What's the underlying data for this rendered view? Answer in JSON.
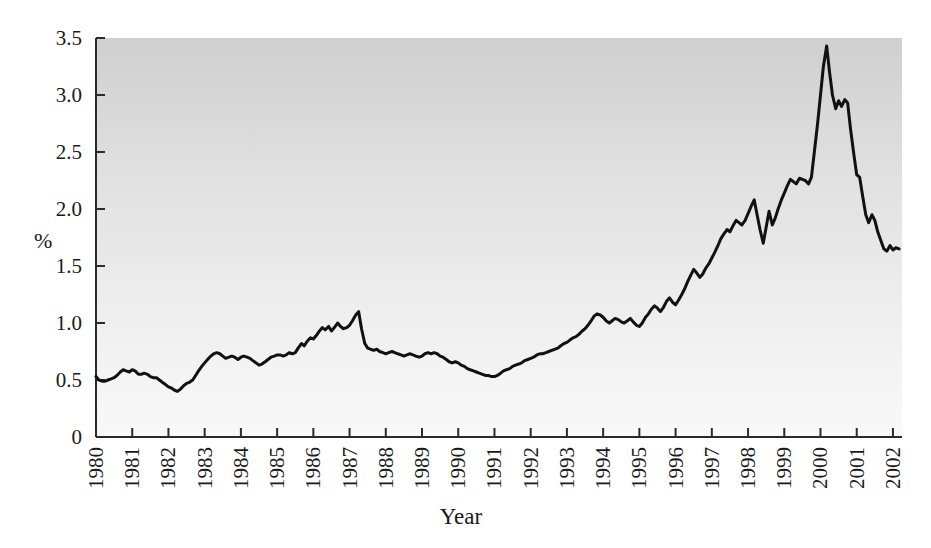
{
  "chart_data": {
    "type": "line",
    "title": "",
    "xlabel": "Year",
    "ylabel": "%",
    "ylim": [
      0,
      3.5
    ],
    "xlim": [
      1980,
      2002.25
    ],
    "yticks": [
      "0",
      "0.5",
      "1.0",
      "1.5",
      "2.0",
      "2.5",
      "3.0",
      "3.5"
    ],
    "ytick_values": [
      0,
      0.5,
      1.0,
      1.5,
      2.0,
      2.5,
      3.0,
      3.5
    ],
    "xticks": [
      "1980",
      "1981",
      "1982",
      "1983",
      "1984",
      "1985",
      "1986",
      "1987",
      "1988",
      "1989",
      "1990",
      "1991",
      "1992",
      "1993",
      "1994",
      "1995",
      "1996",
      "1997",
      "1998",
      "1999",
      "2000",
      "2001",
      "2002"
    ],
    "xtick_values": [
      1980,
      1981,
      1982,
      1983,
      1984,
      1985,
      1986,
      1987,
      1988,
      1989,
      1990,
      1991,
      1992,
      1993,
      1994,
      1995,
      1996,
      1997,
      1998,
      1999,
      2000,
      2001,
      2002
    ],
    "grid": false,
    "legend": false,
    "legend_position": "none",
    "xtick_rotation": 90,
    "plot_background": "vertical-gradient #d2d2d2 to #f7f7f7",
    "line_color": "#111111",
    "series": [
      {
        "name": "percent",
        "x": [
          1980.0,
          1980.08,
          1980.17,
          1980.25,
          1980.33,
          1980.42,
          1980.5,
          1980.58,
          1980.67,
          1980.75,
          1980.83,
          1980.92,
          1981.0,
          1981.08,
          1981.17,
          1981.25,
          1981.33,
          1981.42,
          1981.5,
          1981.58,
          1981.67,
          1981.75,
          1981.83,
          1981.92,
          1982.0,
          1982.08,
          1982.17,
          1982.25,
          1982.33,
          1982.42,
          1982.5,
          1982.58,
          1982.67,
          1982.75,
          1982.83,
          1982.92,
          1983.0,
          1983.08,
          1983.17,
          1983.25,
          1983.33,
          1983.42,
          1983.5,
          1983.58,
          1983.67,
          1983.75,
          1983.83,
          1983.92,
          1984.0,
          1984.08,
          1984.17,
          1984.25,
          1984.33,
          1984.42,
          1984.5,
          1984.58,
          1984.67,
          1984.75,
          1984.83,
          1984.92,
          1985.0,
          1985.08,
          1985.17,
          1985.25,
          1985.33,
          1985.42,
          1985.5,
          1985.58,
          1985.67,
          1985.75,
          1985.83,
          1985.92,
          1986.0,
          1986.08,
          1986.17,
          1986.25,
          1986.33,
          1986.42,
          1986.5,
          1986.58,
          1986.67,
          1986.75,
          1986.83,
          1986.92,
          1987.0,
          1987.08,
          1987.17,
          1987.25,
          1987.33,
          1987.42,
          1987.5,
          1987.58,
          1987.67,
          1987.75,
          1987.83,
          1987.92,
          1988.0,
          1988.08,
          1988.17,
          1988.25,
          1988.33,
          1988.42,
          1988.5,
          1988.58,
          1988.67,
          1988.75,
          1988.83,
          1988.92,
          1989.0,
          1989.08,
          1989.17,
          1989.25,
          1989.33,
          1989.42,
          1989.5,
          1989.58,
          1989.67,
          1989.75,
          1989.83,
          1989.92,
          1990.0,
          1990.08,
          1990.17,
          1990.25,
          1990.33,
          1990.42,
          1990.5,
          1990.58,
          1990.67,
          1990.75,
          1990.83,
          1990.92,
          1991.0,
          1991.08,
          1991.17,
          1991.25,
          1991.33,
          1991.42,
          1991.5,
          1991.58,
          1991.67,
          1991.75,
          1991.83,
          1991.92,
          1992.0,
          1992.08,
          1992.17,
          1992.25,
          1992.33,
          1992.42,
          1992.5,
          1992.58,
          1992.67,
          1992.75,
          1992.83,
          1992.92,
          1993.0,
          1993.08,
          1993.17,
          1993.25,
          1993.33,
          1993.42,
          1993.5,
          1993.58,
          1993.67,
          1993.75,
          1993.83,
          1993.92,
          1994.0,
          1994.08,
          1994.17,
          1994.25,
          1994.33,
          1994.42,
          1994.5,
          1994.58,
          1994.67,
          1994.75,
          1994.83,
          1994.92,
          1995.0,
          1995.08,
          1995.17,
          1995.25,
          1995.33,
          1995.42,
          1995.5,
          1995.58,
          1995.67,
          1995.75,
          1995.83,
          1995.92,
          1996.0,
          1996.08,
          1996.17,
          1996.25,
          1996.33,
          1996.42,
          1996.5,
          1996.58,
          1996.67,
          1996.75,
          1996.83,
          1996.92,
          1997.0,
          1997.08,
          1997.17,
          1997.25,
          1997.33,
          1997.42,
          1997.5,
          1997.58,
          1997.67,
          1997.75,
          1997.83,
          1997.92,
          1998.0,
          1998.08,
          1998.17,
          1998.25,
          1998.33,
          1998.42,
          1998.5,
          1998.58,
          1998.67,
          1998.75,
          1998.83,
          1998.92,
          1999.0,
          1999.08,
          1999.17,
          1999.25,
          1999.33,
          1999.42,
          1999.5,
          1999.58,
          1999.67,
          1999.75,
          1999.83,
          1999.92,
          2000.0,
          2000.08,
          2000.17,
          2000.25,
          2000.33,
          2000.42,
          2000.5,
          2000.58,
          2000.67,
          2000.75,
          2000.83,
          2000.92,
          2001.0,
          2001.08,
          2001.17,
          2001.25,
          2001.33,
          2001.42,
          2001.5,
          2001.58,
          2001.67,
          2001.75,
          2001.83,
          2001.92,
          2002.0,
          2002.08,
          2002.17
        ],
        "values": [
          0.53,
          0.5,
          0.49,
          0.49,
          0.5,
          0.51,
          0.52,
          0.54,
          0.57,
          0.59,
          0.58,
          0.57,
          0.59,
          0.58,
          0.55,
          0.55,
          0.56,
          0.55,
          0.53,
          0.52,
          0.52,
          0.5,
          0.48,
          0.46,
          0.44,
          0.43,
          0.41,
          0.4,
          0.42,
          0.45,
          0.47,
          0.48,
          0.5,
          0.54,
          0.58,
          0.62,
          0.65,
          0.68,
          0.71,
          0.73,
          0.74,
          0.73,
          0.71,
          0.69,
          0.7,
          0.71,
          0.7,
          0.68,
          0.7,
          0.71,
          0.7,
          0.69,
          0.67,
          0.65,
          0.63,
          0.64,
          0.66,
          0.68,
          0.7,
          0.71,
          0.72,
          0.72,
          0.71,
          0.72,
          0.74,
          0.73,
          0.74,
          0.78,
          0.82,
          0.8,
          0.84,
          0.87,
          0.86,
          0.89,
          0.93,
          0.96,
          0.94,
          0.97,
          0.93,
          0.96,
          1.0,
          0.97,
          0.95,
          0.96,
          0.98,
          1.02,
          1.07,
          1.1,
          0.95,
          0.82,
          0.78,
          0.77,
          0.76,
          0.77,
          0.75,
          0.74,
          0.73,
          0.74,
          0.75,
          0.74,
          0.73,
          0.72,
          0.71,
          0.72,
          0.73,
          0.72,
          0.71,
          0.7,
          0.71,
          0.73,
          0.74,
          0.73,
          0.74,
          0.73,
          0.71,
          0.7,
          0.68,
          0.66,
          0.65,
          0.66,
          0.65,
          0.63,
          0.62,
          0.6,
          0.59,
          0.58,
          0.57,
          0.56,
          0.55,
          0.54,
          0.54,
          0.53,
          0.53,
          0.54,
          0.56,
          0.58,
          0.59,
          0.6,
          0.62,
          0.63,
          0.64,
          0.65,
          0.67,
          0.68,
          0.69,
          0.7,
          0.72,
          0.73,
          0.73,
          0.74,
          0.75,
          0.76,
          0.77,
          0.78,
          0.8,
          0.82,
          0.83,
          0.85,
          0.87,
          0.88,
          0.9,
          0.93,
          0.95,
          0.98,
          1.02,
          1.06,
          1.08,
          1.07,
          1.05,
          1.02,
          1.0,
          1.02,
          1.04,
          1.03,
          1.01,
          1.0,
          1.02,
          1.04,
          1.01,
          0.98,
          0.97,
          1.0,
          1.05,
          1.08,
          1.12,
          1.15,
          1.13,
          1.1,
          1.14,
          1.19,
          1.22,
          1.18,
          1.16,
          1.2,
          1.25,
          1.3,
          1.36,
          1.42,
          1.47,
          1.44,
          1.4,
          1.43,
          1.48,
          1.52,
          1.57,
          1.62,
          1.68,
          1.74,
          1.78,
          1.82,
          1.8,
          1.85,
          1.9,
          1.88,
          1.86,
          1.9,
          1.96,
          2.02,
          2.08,
          1.95,
          1.82,
          1.7,
          1.84,
          1.98,
          1.86,
          1.92,
          2.0,
          2.08,
          2.14,
          2.2,
          2.26,
          2.24,
          2.22,
          2.27,
          2.26,
          2.25,
          2.22,
          2.28,
          2.5,
          2.75,
          3.0,
          3.25,
          3.43,
          3.2,
          3.0,
          2.88,
          2.95,
          2.9,
          2.96,
          2.93,
          2.7,
          2.48,
          2.3,
          2.28,
          2.1,
          1.95,
          1.88,
          1.95,
          1.9,
          1.8,
          1.72,
          1.65,
          1.63,
          1.68,
          1.64,
          1.66,
          1.65
        ]
      }
    ],
    "notes": {
      "peak_value": 3.43,
      "peak_year": "2000",
      "trough_value": 0.4,
      "trough_year": "1982",
      "end_value": 1.65,
      "spike_1987_value": 1.1
    }
  },
  "labels": {
    "y_axis_title": "%",
    "x_axis_title": "Year"
  }
}
